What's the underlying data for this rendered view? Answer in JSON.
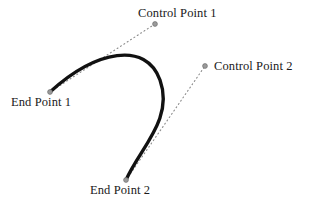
{
  "figure": {
    "kind": "cubic-bezier-curve-diagram",
    "background_color": "#ffffff",
    "curve_color": "#111111",
    "tangent_color": "#8a8a8a",
    "marker_color": "#9a9a9a",
    "marker_outline_color": "#6f6f6f",
    "label_color": "#1a1a1a",
    "curve_width": 3.4,
    "tangent_width": 1.1,
    "tangent_dash": "1,3"
  },
  "labels": {
    "control_point_1": "Control Point 1",
    "control_point_2": "Control Point 2",
    "end_point_1": "End Point 1",
    "end_point_2": "End Point 2"
  },
  "points": {
    "end_point_1": {
      "x": 50,
      "y": 92,
      "label": "End Point 1"
    },
    "control_point_1": {
      "x": 155,
      "y": 24,
      "label": "Control Point 1"
    },
    "control_point_2": {
      "x": 205,
      "y": 66,
      "label": "Control Point 2"
    },
    "end_point_2": {
      "x": 126,
      "y": 180,
      "label": "End Point 2"
    }
  },
  "geometry": {
    "curve_path": "M 50 92 C 96 50 146 41 160 80 C 174 119 140 148 126 180",
    "tangent_1_path": "M 50 92 L 155 24",
    "tangent_2_path": "M 126 180 L 205 66",
    "marker_radius": 2.4
  }
}
